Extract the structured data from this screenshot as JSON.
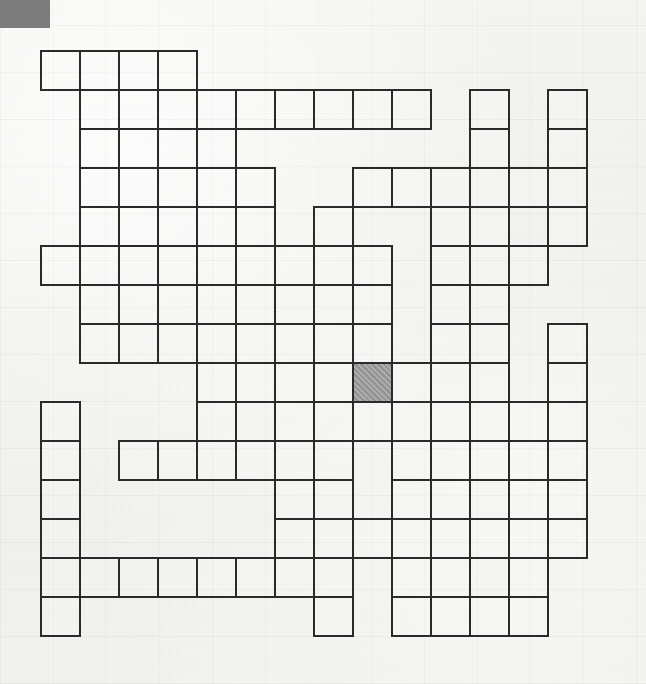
{
  "page": {
    "background_color": "#f3f3f1",
    "width": 646,
    "height": 684
  },
  "corner_block": {
    "name": "corner-marker",
    "color": "#7c7c7c",
    "x": 0,
    "y": 0,
    "width": 50,
    "height": 28
  },
  "grid": {
    "origin_x": 40,
    "origin_y": 50,
    "cell_size": 39,
    "columns": 14,
    "rows": 15,
    "line_color": "#2a2a2a",
    "cell_fill": "#f5f5f3",
    "shaded_fill": "#9a9a9a",
    "shaded_cells": [
      [
        8,
        8
      ]
    ],
    "cells": [
      [
        0,
        0
      ],
      [
        1,
        0
      ],
      [
        2,
        0
      ],
      [
        3,
        0
      ],
      [
        1,
        1
      ],
      [
        2,
        1
      ],
      [
        3,
        1
      ],
      [
        4,
        1
      ],
      [
        5,
        1
      ],
      [
        6,
        1
      ],
      [
        7,
        1
      ],
      [
        8,
        1
      ],
      [
        9,
        1
      ],
      [
        11,
        1
      ],
      [
        13,
        1
      ],
      [
        1,
        2
      ],
      [
        2,
        2
      ],
      [
        3,
        2
      ],
      [
        4,
        2
      ],
      [
        11,
        2
      ],
      [
        13,
        2
      ],
      [
        1,
        3
      ],
      [
        2,
        3
      ],
      [
        3,
        3
      ],
      [
        4,
        3
      ],
      [
        5,
        3
      ],
      [
        8,
        3
      ],
      [
        9,
        3
      ],
      [
        10,
        3
      ],
      [
        11,
        3
      ],
      [
        12,
        3
      ],
      [
        13,
        3
      ],
      [
        1,
        4
      ],
      [
        2,
        4
      ],
      [
        3,
        4
      ],
      [
        4,
        4
      ],
      [
        5,
        4
      ],
      [
        7,
        4
      ],
      [
        10,
        4
      ],
      [
        11,
        4
      ],
      [
        13,
        4
      ],
      [
        0,
        5
      ],
      [
        1,
        5
      ],
      [
        2,
        5
      ],
      [
        3,
        5
      ],
      [
        4,
        5
      ],
      [
        5,
        5
      ],
      [
        6,
        5
      ],
      [
        7,
        5
      ],
      [
        8,
        5
      ],
      [
        10,
        5
      ],
      [
        11,
        5
      ],
      [
        12,
        5
      ],
      [
        1,
        6
      ],
      [
        2,
        6
      ],
      [
        3,
        6
      ],
      [
        4,
        6
      ],
      [
        5,
        6
      ],
      [
        6,
        6
      ],
      [
        7,
        6
      ],
      [
        8,
        6
      ],
      [
        10,
        6
      ],
      [
        11,
        6
      ],
      [
        1,
        7
      ],
      [
        2,
        7
      ],
      [
        3,
        7
      ],
      [
        4,
        7
      ],
      [
        5,
        7
      ],
      [
        6,
        7
      ],
      [
        7,
        7
      ],
      [
        8,
        7
      ],
      [
        10,
        7
      ],
      [
        11,
        7
      ],
      [
        13,
        7
      ],
      [
        4,
        8
      ],
      [
        5,
        8
      ],
      [
        6,
        8
      ],
      [
        7,
        8
      ],
      [
        8,
        8
      ],
      [
        9,
        8
      ],
      [
        10,
        8
      ],
      [
        11,
        8
      ],
      [
        13,
        8
      ],
      [
        0,
        9
      ],
      [
        4,
        9
      ],
      [
        6,
        9
      ],
      [
        7,
        9
      ],
      [
        8,
        9
      ],
      [
        9,
        9
      ],
      [
        10,
        9
      ],
      [
        11,
        9
      ],
      [
        12,
        9
      ],
      [
        13,
        9
      ],
      [
        0,
        10
      ],
      [
        2,
        10
      ],
      [
        3,
        10
      ],
      [
        4,
        10
      ],
      [
        5,
        10
      ],
      [
        6,
        10
      ],
      [
        7,
        10
      ],
      [
        9,
        10
      ],
      [
        10,
        10
      ],
      [
        11,
        10
      ],
      [
        12,
        10
      ],
      [
        13,
        10
      ],
      [
        0,
        11
      ],
      [
        6,
        11
      ],
      [
        7,
        11
      ],
      [
        9,
        11
      ],
      [
        10,
        11
      ],
      [
        12,
        11
      ],
      [
        13,
        11
      ],
      [
        0,
        12
      ],
      [
        6,
        12
      ],
      [
        7,
        12
      ],
      [
        8,
        12
      ],
      [
        9,
        12
      ],
      [
        10,
        12
      ],
      [
        11,
        12
      ],
      [
        12,
        12
      ],
      [
        13,
        12
      ],
      [
        0,
        13
      ],
      [
        1,
        13
      ],
      [
        2,
        13
      ],
      [
        3,
        13
      ],
      [
        4,
        13
      ],
      [
        5,
        13
      ],
      [
        6,
        13
      ],
      [
        7,
        13
      ],
      [
        9,
        13
      ],
      [
        10,
        13
      ],
      [
        12,
        13
      ],
      [
        0,
        14
      ],
      [
        7,
        14
      ],
      [
        9,
        14
      ],
      [
        10,
        14
      ],
      [
        11,
        14
      ],
      [
        12,
        14
      ]
    ]
  }
}
